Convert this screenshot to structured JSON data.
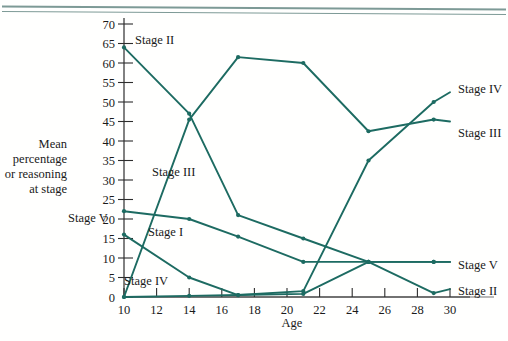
{
  "figure": {
    "background_color": "#fffffe",
    "line_color": "#1d6b62",
    "axis_color": "#2d2d2d",
    "top_rule_color": "#7d9a96"
  },
  "axis_titles": {
    "x": "Age",
    "y_lines": [
      "Mean",
      "percentage",
      "or reasoning",
      "at stage"
    ]
  },
  "labels": {
    "left_stage_ii": "Stage II",
    "left_stage_iii": "Stage III",
    "left_stage_i": "Stage I",
    "left_stage_iv": "Stage IV",
    "left_stage_v": "Stage V",
    "right_stage_iv": "Stage IV",
    "right_stage_iii": "Stage III",
    "right_stage_v": "Stage V",
    "right_stage_ii": "Stage II"
  },
  "chart_data": {
    "type": "line",
    "title": "",
    "xlabel": "Age",
    "ylabel": "Mean percentage or reasoning at stage",
    "xlim": [
      10,
      30
    ],
    "ylim": [
      0,
      70
    ],
    "xticks": [
      10,
      12,
      14,
      16,
      18,
      20,
      22,
      24,
      26,
      28,
      30
    ],
    "yticks": [
      0,
      5,
      10,
      15,
      20,
      25,
      30,
      35,
      40,
      45,
      50,
      55,
      60,
      65,
      70
    ],
    "grid": false,
    "legend_position": "inline-labels",
    "series": [
      {
        "name": "Stage II",
        "label_left": "Stage II",
        "label_right": "Stage II",
        "x": [
          10,
          14,
          17,
          21,
          25,
          29,
          30
        ],
        "values": [
          64,
          47,
          21,
          15,
          9,
          1,
          2
        ]
      },
      {
        "name": "Stage III",
        "label_left": "Stage III",
        "label_right": "Stage III",
        "x": [
          10,
          14,
          17,
          21,
          25,
          29,
          30
        ],
        "values": [
          0,
          45.5,
          61.5,
          60,
          42.5,
          45.5,
          45
        ]
      },
      {
        "name": "Stage I",
        "label_left": "Stage I",
        "x": [
          10,
          14,
          17,
          21,
          25,
          29,
          30
        ],
        "values": [
          22,
          20,
          15.5,
          9,
          9,
          9,
          9
        ]
      },
      {
        "name": "Stage IV",
        "label_left": "Stage IV",
        "label_right": "Stage IV",
        "x": [
          10,
          14,
          17,
          21,
          25,
          29,
          30
        ],
        "values": [
          16,
          5,
          0.5,
          1.5,
          35,
          50,
          52.5
        ]
      },
      {
        "name": "Stage V",
        "label_left": "Stage V",
        "label_right": "Stage V",
        "x": [
          10,
          14,
          17,
          21,
          25,
          29,
          30
        ],
        "values": [
          0,
          0.3,
          0.5,
          0.8,
          9,
          9,
          9
        ]
      }
    ]
  }
}
